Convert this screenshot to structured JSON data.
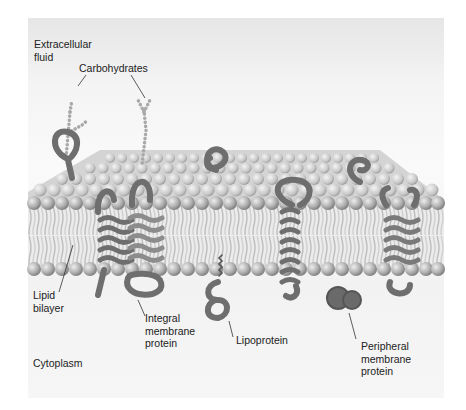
{
  "diagram": {
    "type": "fluid mosaic model of the cell membrane",
    "labels": {
      "extracellular": "Extracellular fluid",
      "extracellular_line1": "Extracellular",
      "extracellular_line2": "fluid",
      "carbohydrates": "Carbohydrates",
      "lipid_line1": "Lipid",
      "lipid_line2": "bilayer",
      "integral_line1": "Integral",
      "integral_line2": "membrane",
      "integral_line3": "protein",
      "lipoprotein": "Lipoprotein",
      "peripheral_line1": "Peripheral",
      "peripheral_line2": "membrane",
      "peripheral_line3": "protein",
      "cytoplasm": "Cytoplasm"
    },
    "colors": {
      "lipid_head": "#b5b5b5",
      "lipid_tail": "#d8d8d8",
      "protein": "#6e6e6e",
      "protein_light": "#9a9a9a",
      "carbohydrate": "#a8a8a8",
      "text": "#222222"
    }
  }
}
